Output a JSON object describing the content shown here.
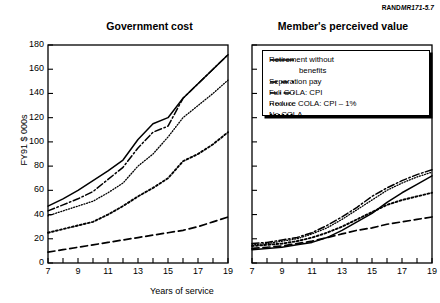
{
  "source_label": {
    "rand": "RAND",
    "mr": "MR171",
    "suffix": "-5.7",
    "full": "RANDMR171-5.7"
  },
  "axes": {
    "ylabel": "FY91 $ 000s",
    "xlabel": "Years of service",
    "yticks": [
      "180",
      "160",
      "140",
      "120",
      "100",
      "80",
      "60",
      "40",
      "20",
      "0"
    ],
    "xticks": [
      "7",
      "9",
      "11",
      "13",
      "15",
      "17",
      "19"
    ],
    "ylim": [
      0,
      180
    ],
    "xlim": [
      7,
      19
    ],
    "grid": false
  },
  "legend": {
    "position": "top-right",
    "items": [
      {
        "label": "Retirement without",
        "label2": "benefits",
        "style": "solid",
        "key": "retirement_without_benefits"
      },
      {
        "label": "Separation pay",
        "style": "dashed",
        "key": "separation_pay"
      },
      {
        "label": "Full COLA:  CPI",
        "style": "dash-dot",
        "key": "full_cola_cpi"
      },
      {
        "label": "Reduce COLA:  CPI – 1%",
        "style": "dotted-fine",
        "key": "reduce_cola_cpi_minus_1"
      },
      {
        "label": "No COLA",
        "style": "dotted-coarse",
        "key": "no_cola"
      }
    ]
  },
  "chart_data": {
    "type": "line",
    "title": "",
    "xlabel": "Years of service",
    "ylabel": "FY91 $ 000s",
    "xlim": [
      7,
      19
    ],
    "ylim": [
      0,
      180
    ],
    "grid": false,
    "panels": [
      {
        "title": "Government cost",
        "x": [
          7,
          8,
          9,
          10,
          11,
          12,
          13,
          14,
          15,
          16,
          17,
          18,
          19
        ],
        "series": [
          {
            "name": "Retirement without benefits",
            "style": "solid",
            "values": [
              47,
              53,
              60,
              68,
              76,
              85,
              102,
              115,
              120,
              136,
              148,
              160,
              172
            ]
          },
          {
            "name": "Separation pay",
            "style": "dashed",
            "values": [
              9,
              11,
              13,
              15,
              17,
              19,
              21,
              23,
              25,
              27,
              30,
              34,
              38
            ]
          },
          {
            "name": "Full COLA: CPI",
            "style": "dash-dot",
            "values": [
              43,
              48,
              53,
              59,
              69,
              79,
              95,
              108,
              113,
              136,
              148,
              160,
              172
            ]
          },
          {
            "name": "Reduce COLA: CPI - 1%",
            "style": "dotted-fine",
            "values": [
              39,
              43,
              47,
              51,
              58,
              66,
              80,
              90,
              104,
              120,
              130,
              140,
              151
            ]
          },
          {
            "name": "No COLA",
            "style": "dotted-coarse",
            "values": [
              25,
              28,
              31,
              34,
              40,
              47,
              55,
              62,
              70,
              84,
              90,
              98,
              108
            ]
          }
        ]
      },
      {
        "title": "Member's perceived value",
        "x": [
          7,
          8,
          9,
          10,
          11,
          12,
          13,
          14,
          15,
          16,
          17,
          18,
          19
        ],
        "series": [
          {
            "name": "Retirement without benefits",
            "style": "solid",
            "values": [
              11,
              12,
              13,
              15,
              17,
              21,
              27,
              34,
              41,
              50,
              58,
              65,
              72
            ]
          },
          {
            "name": "Separation pay",
            "style": "dashed",
            "values": [
              12,
              13,
              14,
              16,
              18,
              21,
              24,
              27,
              29,
              32,
              34,
              36,
              38
            ]
          },
          {
            "name": "Full COLA: CPI",
            "style": "dash-dot",
            "values": [
              16,
              17,
              19,
              21,
              25,
              31,
              38,
              46,
              55,
              62,
              68,
              73,
              77
            ]
          },
          {
            "name": "Reduce COLA: CPI - 1%",
            "style": "dotted-fine",
            "values": [
              15,
              16,
              18,
              20,
              24,
              29,
              36,
              44,
              52,
              60,
              66,
              71,
              75
            ]
          },
          {
            "name": "No COLA",
            "style": "dotted-coarse",
            "values": [
              14,
              15,
              16,
              18,
              21,
              25,
              30,
              36,
              42,
              48,
              52,
              55,
              58
            ]
          }
        ]
      }
    ]
  }
}
